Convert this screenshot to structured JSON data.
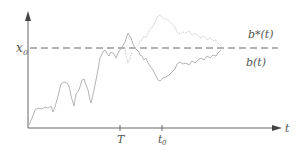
{
  "diagram": {
    "type": "brownian-motion-reflection",
    "axes": {
      "x_label": "t",
      "y_level_label": "x₀",
      "x_ticks": [
        "T",
        "t₀"
      ]
    },
    "curves": [
      {
        "name": "b(t)",
        "label": "b(t)",
        "style": "solid"
      },
      {
        "name": "b*(t)",
        "label": "b*(t)",
        "style": "dotted-reflected"
      }
    ],
    "level_line": {
      "label": "x₀",
      "style": "dashed"
    },
    "colors": {
      "axis": "#555555",
      "curve": "#b0b0b0",
      "reflected": "#c8c8c8",
      "dashed": "#666666"
    }
  }
}
